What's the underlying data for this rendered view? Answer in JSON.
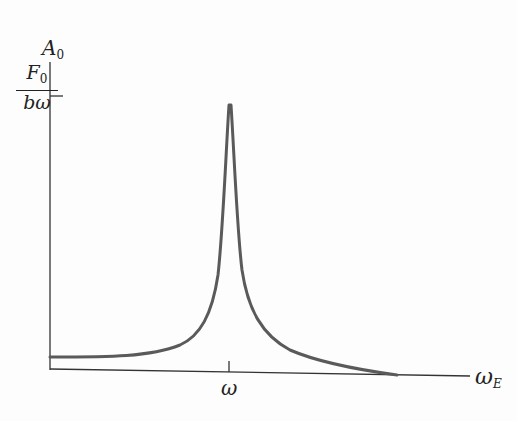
{
  "diagram": {
    "type": "resonance-curve",
    "y_axis": {
      "label_main": "A",
      "label_sub": "0"
    },
    "y_tick": {
      "numerator_main": "F",
      "numerator_sub": "0",
      "denominator": "bω"
    },
    "x_axis": {
      "label_main": "ω",
      "label_sub": "E"
    },
    "x_tick": {
      "label": "ω"
    },
    "colors": {
      "curve": "#5a5a5a",
      "axis": "#333333"
    }
  }
}
